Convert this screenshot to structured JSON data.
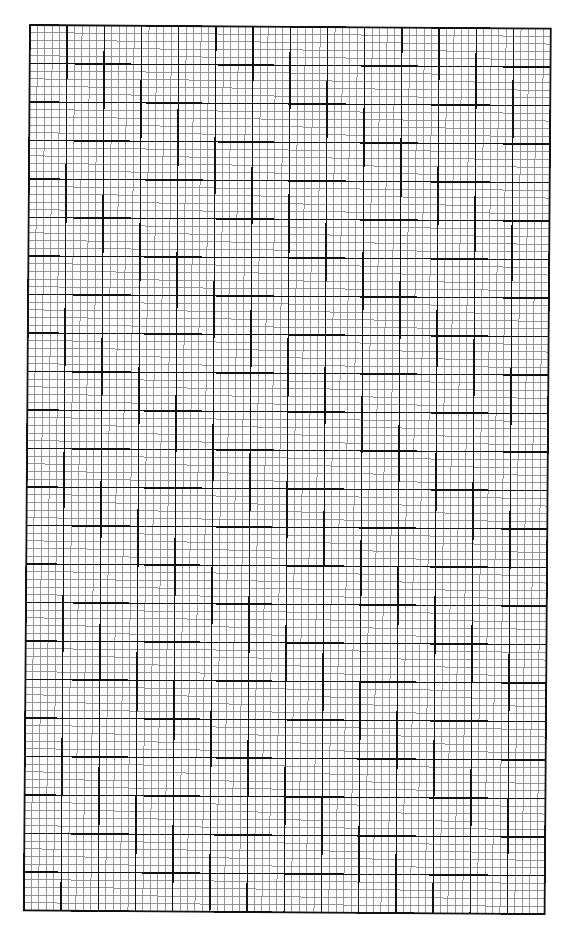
{
  "page": {
    "title": "Graph paper",
    "background": "#ffffff"
  },
  "grid": {
    "origin_x": 30,
    "origin_y": 25,
    "major_cols": 14,
    "major_rows": 23,
    "major_w": 37.2,
    "major_h": 38.5,
    "subdivisions": 5,
    "rotation_deg": 0.4,
    "major_color": "#111111",
    "minor_color": "#8a8a8a",
    "border_color": "#111111",
    "major_width": 1.4,
    "minor_width": 0.9,
    "border_width": 1.8
  }
}
